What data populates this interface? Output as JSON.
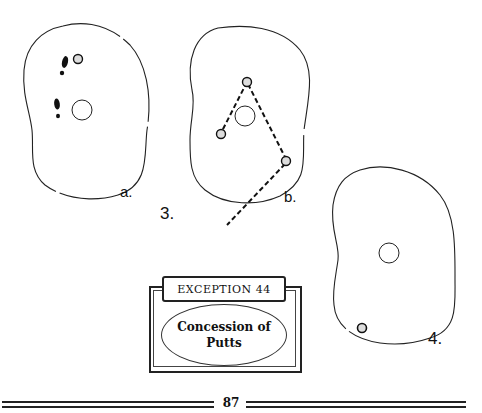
{
  "figures": {
    "fig3": {
      "number_label": "3.",
      "panels": [
        {
          "label": "a.",
          "elements": [
            "green-outline",
            "hole",
            "ball",
            "footprint",
            "footprint"
          ]
        },
        {
          "label": "b.",
          "elements": [
            "green-outline",
            "hole",
            "ball",
            "ball",
            "ball",
            "dashed-path"
          ]
        }
      ]
    },
    "fig4": {
      "number_label": "4.",
      "elements": [
        "green-outline",
        "hole",
        "ball"
      ]
    }
  },
  "exception_box": {
    "banner": "EXCEPTION 44",
    "title": "Concession of\nPutts"
  },
  "footer": {
    "page_number": "87"
  }
}
